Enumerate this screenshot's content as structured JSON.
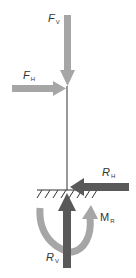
{
  "diagram": {
    "title": "",
    "colors": {
      "applied_force": "#a6a6a6",
      "reaction_force": "#595959",
      "moment": "#a6a6a6",
      "column": "#333333",
      "ground": "#333333"
    },
    "labels": {
      "fv": {
        "main": "F",
        "sub": "V"
      },
      "fh": {
        "main": "F",
        "sub": "H"
      },
      "rh": {
        "main": "R",
        "sub": "H"
      },
      "rv": {
        "main": "R",
        "sub": "V"
      },
      "mr": {
        "main": "M",
        "sub": "R"
      }
    },
    "elements": [
      {
        "id": "column",
        "type": "line",
        "description": "vertical column"
      },
      {
        "id": "fv",
        "type": "arrow",
        "direction": "down",
        "label": "F_V"
      },
      {
        "id": "fh",
        "type": "arrow",
        "direction": "right",
        "label": "F_H"
      },
      {
        "id": "ground",
        "type": "fixed-support",
        "description": "hatched ground"
      },
      {
        "id": "rh",
        "type": "arrow",
        "direction": "left",
        "label": "R_H"
      },
      {
        "id": "rv",
        "type": "arrow",
        "direction": "up",
        "label": "R_V"
      },
      {
        "id": "mr",
        "type": "moment-arc",
        "direction": "counterclockwise",
        "label": "M_R"
      }
    ]
  }
}
